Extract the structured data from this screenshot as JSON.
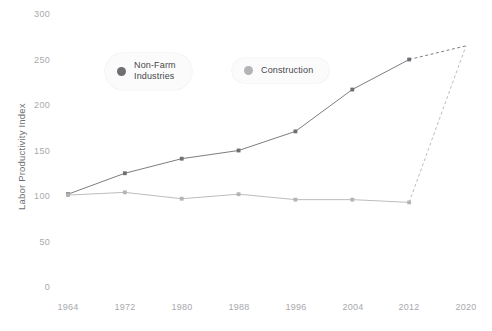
{
  "chart_data": {
    "type": "line",
    "title": "",
    "xlabel": "",
    "ylabel": "Labor Productivity Index",
    "x": [
      1964,
      1972,
      1980,
      1988,
      1996,
      2004,
      2012,
      2020
    ],
    "xticklabels": [
      "1964",
      "1972",
      "1980",
      "1988",
      "1996",
      "2004",
      "2012",
      "2020"
    ],
    "yticklabels": [
      "0",
      "50",
      "100",
      "150",
      "200",
      "250",
      "300"
    ],
    "yticks": [
      0,
      50,
      100,
      150,
      200,
      250,
      300
    ],
    "xlim": [
      1964,
      2020
    ],
    "ylim": [
      0,
      300
    ],
    "grid": false,
    "legend_position": "top-center",
    "series": [
      {
        "name": "Non-Farm Industries",
        "color": "#6e6e73",
        "values": [
          102,
          125,
          141,
          150,
          171,
          217,
          250,
          265
        ],
        "solid_until": 2012,
        "dashed_from": 2012
      },
      {
        "name": "Construction",
        "color": "#b4b4b8",
        "values": [
          101,
          104,
          97,
          102,
          96,
          96,
          93,
          265
        ],
        "solid_until": 2012,
        "dashed_from": 2012
      }
    ]
  },
  "legend": {
    "items": [
      {
        "label": "Non-Farm\nIndustries",
        "color": "#6e6e73"
      },
      {
        "label": "Construction",
        "color": "#b4b4b8"
      }
    ]
  },
  "colors": {
    "background": "#ffffff",
    "tick_text": "#a9a9ad",
    "axis_title_text": "#6e6e73",
    "series_primary": "#6e6e73",
    "series_secondary": "#b4b4b8",
    "legend_pill_bg": "#fbfbfc"
  }
}
